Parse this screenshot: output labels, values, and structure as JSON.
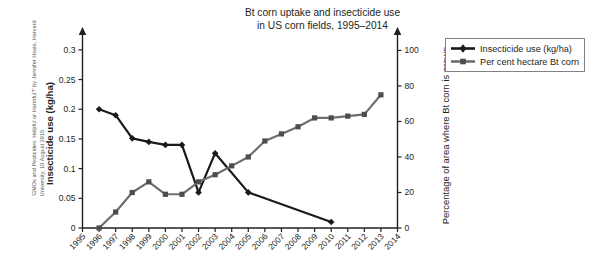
{
  "title": {
    "line1": "Bt corn uptake and insecticide use",
    "line2": "in US corn fields, 1995–2014"
  },
  "credit": "'GMOs and Pesticides: Helpful or Harmful?' by Jennifer Hsaio, Harvard\nUniversity, 10 August 2015",
  "legend": {
    "items": [
      {
        "label": "Insecticide use (kg/ha)",
        "color": "#1a1a1a",
        "marker": "diamond"
      },
      {
        "label": "Per cent hectare Bt corn",
        "color": "#6e6e6e",
        "marker": "square"
      }
    ]
  },
  "chart_data": {
    "type": "line",
    "title": "Bt corn uptake and insecticide use in US corn fields, 1995–2014",
    "xlabel": "",
    "ylabel": "Insecticide use (kg/ha)",
    "y2label": "Percentage of area where Bt corn is grown",
    "grid": false,
    "legend_position": "top-right",
    "x": [
      1995,
      1996,
      1997,
      1998,
      1999,
      2000,
      2001,
      2002,
      2003,
      2004,
      2005,
      2006,
      2007,
      2008,
      2009,
      2010,
      2011,
      2012,
      2013,
      2014
    ],
    "xtick_labels": [
      "1995",
      "1996",
      "1997",
      "1998",
      "1999",
      "2000",
      "2001",
      "2002",
      "2003",
      "2004",
      "2005",
      "2006",
      "2007",
      "2008",
      "2009",
      "2010",
      "2011",
      "2012",
      "2013",
      "2014"
    ],
    "ylim": [
      0,
      0.32
    ],
    "ytick_values": [
      0,
      0.05,
      0.1,
      0.15,
      0.2,
      0.25,
      0.3
    ],
    "ytick_labels": [
      "0",
      "0.05",
      "0.1",
      "0.15",
      "0.2",
      "0.25",
      "0.3"
    ],
    "y2lim": [
      0,
      107
    ],
    "y2tick_values": [
      0,
      20,
      40,
      60,
      80,
      100
    ],
    "y2tick_labels": [
      "0",
      "20",
      "40",
      "60",
      "80",
      "100"
    ],
    "series": [
      {
        "name": "Insecticide use (kg/ha)",
        "axis": "left",
        "color": "#1a1a1a",
        "marker": "diamond",
        "points": [
          {
            "x": 1996,
            "y": 0.2
          },
          {
            "x": 1997,
            "y": 0.19
          },
          {
            "x": 1998,
            "y": 0.151
          },
          {
            "x": 1999,
            "y": 0.145
          },
          {
            "x": 2000,
            "y": 0.14
          },
          {
            "x": 2001,
            "y": 0.14
          },
          {
            "x": 2002,
            "y": 0.06
          },
          {
            "x": 2003,
            "y": 0.126
          },
          {
            "x": 2005,
            "y": 0.06
          },
          {
            "x": 2010,
            "y": 0.01
          }
        ]
      },
      {
        "name": "Per cent hectare Bt corn",
        "axis": "right",
        "color": "#6e6e6e",
        "marker": "square",
        "points": [
          {
            "x": 1996,
            "y": 0
          },
          {
            "x": 1997,
            "y": 9
          },
          {
            "x": 1998,
            "y": 20
          },
          {
            "x": 1999,
            "y": 26
          },
          {
            "x": 2000,
            "y": 19
          },
          {
            "x": 2001,
            "y": 19
          },
          {
            "x": 2002,
            "y": 26
          },
          {
            "x": 2003,
            "y": 30
          },
          {
            "x": 2004,
            "y": 35
          },
          {
            "x": 2005,
            "y": 40
          },
          {
            "x": 2006,
            "y": 49
          },
          {
            "x": 2007,
            "y": 53
          },
          {
            "x": 2008,
            "y": 57
          },
          {
            "x": 2009,
            "y": 62
          },
          {
            "x": 2010,
            "y": 62
          },
          {
            "x": 2011,
            "y": 63
          },
          {
            "x": 2012,
            "y": 64
          },
          {
            "x": 2013,
            "y": 75
          }
        ]
      }
    ]
  }
}
